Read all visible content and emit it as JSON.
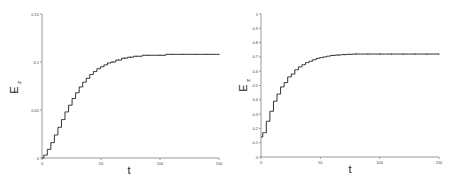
{
  "chart_data": [
    {
      "type": "line",
      "title": "",
      "xlabel": "t",
      "ylabel": "E",
      "ylabel_subscript": "z",
      "xlim": [
        0,
        150
      ],
      "ylim": [
        0,
        0.15
      ],
      "xticks": [
        0,
        50,
        100,
        150
      ],
      "xtick_labels": [
        "0",
        "50",
        "100",
        "150"
      ],
      "yticks": [
        0,
        0.05,
        0.1,
        0.15
      ],
      "ytick_labels": [
        "0",
        "0.05",
        "0.1",
        "0.15"
      ],
      "grid": false,
      "series": [
        {
          "name": "E_z",
          "style": "staircase",
          "x": [
            0,
            3,
            6,
            9,
            12,
            15,
            18,
            21,
            24,
            27,
            30,
            33,
            36,
            39,
            42,
            45,
            48,
            51,
            54,
            57,
            60,
            65,
            70,
            75,
            80,
            90,
            100,
            110,
            120,
            130,
            140,
            150
          ],
          "values": [
            0,
            0.003,
            0.009,
            0.016,
            0.024,
            0.032,
            0.04,
            0.048,
            0.055,
            0.062,
            0.068,
            0.074,
            0.079,
            0.083,
            0.087,
            0.09,
            0.093,
            0.095,
            0.097,
            0.099,
            0.1,
            0.102,
            0.104,
            0.105,
            0.106,
            0.107,
            0.107,
            0.108,
            0.108,
            0.108,
            0.108,
            0.108
          ]
        }
      ]
    },
    {
      "type": "line",
      "title": "",
      "xlabel": "t",
      "ylabel": "E",
      "ylabel_subscript": "z",
      "xlim": [
        0,
        150
      ],
      "ylim": [
        0,
        1
      ],
      "xticks": [
        0,
        50,
        100,
        150
      ],
      "xtick_labels": [
        "0",
        "50",
        "100",
        "150"
      ],
      "yticks": [
        0,
        0.1,
        0.2,
        0.3,
        0.4,
        0.5,
        0.6,
        0.7,
        0.8,
        0.9,
        1
      ],
      "ytick_labels": [
        "0",
        "0.1",
        "0.2",
        "0.3",
        "0.4",
        "0.5",
        "0.6",
        "0.7",
        "0.8",
        "0.9",
        "1"
      ],
      "grid": false,
      "series": [
        {
          "name": "E_z",
          "style": "staircase",
          "x": [
            0,
            3,
            6,
            9,
            12,
            15,
            18,
            21,
            24,
            27,
            30,
            33,
            36,
            39,
            42,
            45,
            48,
            51,
            54,
            57,
            60,
            65,
            70,
            75,
            80,
            90,
            100,
            110,
            120,
            130,
            140,
            150
          ],
          "values": [
            0.14,
            0.17,
            0.25,
            0.32,
            0.39,
            0.44,
            0.49,
            0.52,
            0.56,
            0.58,
            0.61,
            0.63,
            0.645,
            0.66,
            0.67,
            0.68,
            0.69,
            0.695,
            0.7,
            0.705,
            0.71,
            0.713,
            0.716,
            0.718,
            0.72,
            0.72,
            0.72,
            0.72,
            0.72,
            0.72,
            0.72,
            0.72
          ]
        }
      ]
    }
  ]
}
